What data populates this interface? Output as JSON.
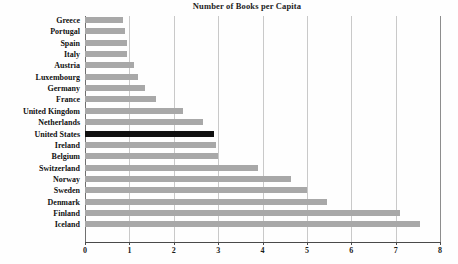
{
  "chart_data": {
    "type": "bar",
    "orientation": "horizontal",
    "title": "Number of Books per Capita",
    "xlabel": "",
    "ylabel": "",
    "xlim": [
      0,
      8
    ],
    "xticks": [
      0,
      1,
      2,
      3,
      4,
      5,
      6,
      7,
      8
    ],
    "xtick_labels": [
      "0",
      "1",
      "2",
      "3",
      "4",
      "5",
      "6",
      "7",
      "8"
    ],
    "grid": true,
    "legend": null,
    "categories": [
      "Greece",
      "Portugal",
      "Spain",
      "Italy",
      "Austria",
      "Luxembourg",
      "Germany",
      "France",
      "United Kingdom",
      "Netherlands",
      "United States",
      "Ireland",
      "Belgium",
      "Switzerland",
      "Norway",
      "Sweden",
      "Denmark",
      "Finland",
      "Iceland"
    ],
    "values": [
      0.85,
      0.9,
      0.95,
      0.95,
      1.1,
      1.2,
      1.35,
      1.6,
      2.2,
      2.65,
      2.9,
      2.95,
      3.0,
      3.9,
      4.65,
      5.0,
      5.45,
      7.1,
      7.55
    ],
    "highlight_category": "United States",
    "colors": {
      "bar": "#a8a8a8",
      "highlight_bar": "#101010",
      "gridline": "#c9c9c9",
      "axis": "#4a4a4a",
      "background": "#fefefe",
      "text": "#111111"
    }
  }
}
